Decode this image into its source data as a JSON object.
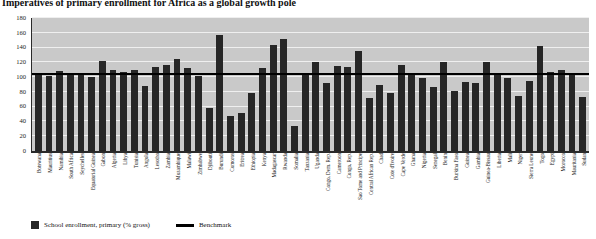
{
  "chart_data": {
    "type": "bar",
    "title": "Imperatives of primary enrollment for Africa as a global growth pole",
    "xlabel": "",
    "ylabel": "",
    "ylim": [
      0,
      180
    ],
    "yticks": [
      0,
      20,
      40,
      60,
      80,
      100,
      120,
      140,
      160,
      180
    ],
    "grid": true,
    "legend_position": "bottom-left",
    "legend": [
      {
        "label": "School enrollment, primary (% gross)",
        "marker": "square",
        "color": "#262626"
      },
      {
        "label": "Benchmark",
        "marker": "line",
        "color": "#000000"
      }
    ],
    "benchmark": 103,
    "categories": [
      "Botswana",
      "Mauritius",
      "Namibia",
      "South Africa",
      "Seychelles",
      "Equatorial Guinea",
      "Gabon",
      "Algeria",
      "Libya",
      "Tunisia",
      "Angola",
      "Lesotho",
      "Zambia",
      "Mozambique",
      "Malawi",
      "Zimbabwe",
      "Djibouti",
      "Burundi",
      "Comoros",
      "Eritrea",
      "Ethiopia",
      "Kenya",
      "Madagascar",
      "Rwanda",
      "Somalia",
      "Tanzania",
      "Uganda",
      "Congo, Dem. Rep.",
      "Cameroon",
      "Congo, Rep.",
      "Sao Tome and Principe",
      "Central African Rep.",
      "Chad",
      "Cote d'Ivoire",
      "Cape Verde",
      "Ghana",
      "Nigeria",
      "Senegal",
      "Benin",
      "Burkina Faso",
      "Guinea",
      "Gambia",
      "Guinea-Bissau",
      "Liberia",
      "Mali",
      "Niger",
      "Sierra Leone",
      "Togo",
      "Egypt",
      "Morocco",
      "Mauritania",
      "Sudan"
    ],
    "values": [
      106,
      102,
      108,
      103,
      103,
      100,
      122,
      110,
      107,
      109,
      88,
      114,
      117,
      125,
      112,
      102,
      58,
      157,
      48,
      52,
      79,
      113,
      144,
      151,
      34,
      104,
      121,
      92,
      115,
      114,
      135,
      72,
      89,
      79,
      116,
      105,
      99,
      86,
      121,
      81,
      94,
      92,
      120,
      105,
      99,
      75,
      95,
      142,
      107,
      110,
      105,
      73
    ],
    "series_name": "School enrollment, primary (% gross)"
  }
}
